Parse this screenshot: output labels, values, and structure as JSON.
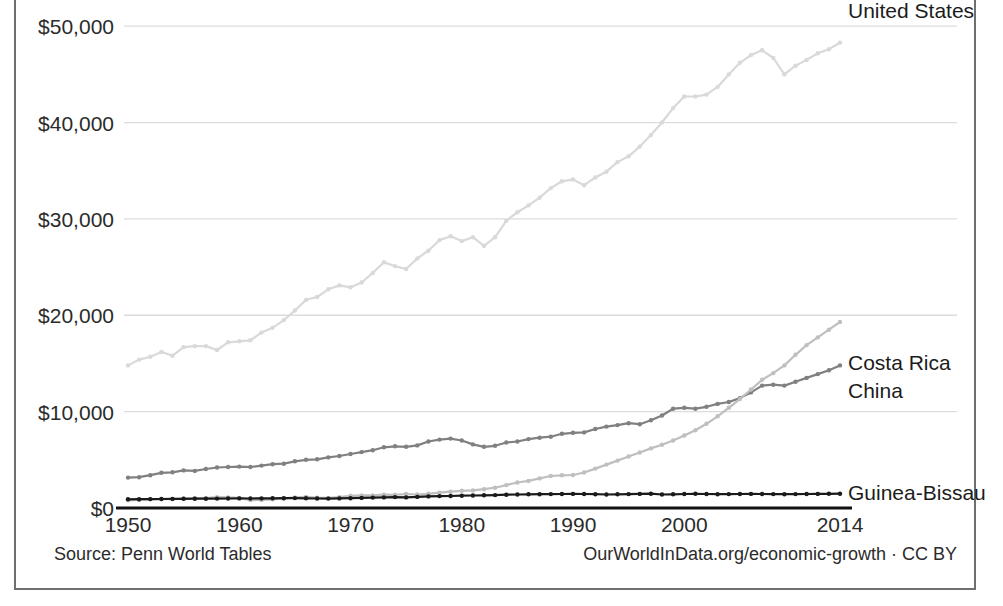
{
  "footer": {
    "source_label": "Source: Penn World Tables",
    "credit_label": "OurWorldInData.org/economic-growth · CC BY"
  },
  "axes": {
    "y_ticks": [
      "$0",
      "$10,000",
      "$20,000",
      "$30,000",
      "$40,000",
      "$50,000"
    ],
    "y_tick_values": [
      0,
      10000,
      20000,
      30000,
      40000,
      50000
    ],
    "x_ticks": [
      "1950",
      "1960",
      "1970",
      "1980",
      "1990",
      "2000",
      "2014"
    ],
    "x_tick_values": [
      1950,
      1960,
      1970,
      1980,
      1990,
      2000,
      2014
    ]
  },
  "series_labels": {
    "united_states": "United States",
    "costa_rica": "Costa Rica",
    "china": "China",
    "guinea_bissau": "Guinea-Bissau"
  },
  "colors": {
    "united_states": "#d9d9d9",
    "costa_rica": "#808080",
    "china": "#bfbfbf",
    "guinea_bissau": "#1a1a1a",
    "gridline": "#dcdcdc",
    "axis": "#111111",
    "frame": "#6f6f6f",
    "text": "#1f1f1f"
  },
  "chart_data": {
    "type": "line",
    "title": "",
    "xlabel": "",
    "ylabel": "",
    "xlim": [
      1950,
      2014
    ],
    "ylim": [
      0,
      55000
    ],
    "grid": true,
    "legend": "inline-right-labels",
    "x": [
      1950,
      1951,
      1952,
      1953,
      1954,
      1955,
      1956,
      1957,
      1958,
      1959,
      1960,
      1961,
      1962,
      1963,
      1964,
      1965,
      1966,
      1967,
      1968,
      1969,
      1970,
      1971,
      1972,
      1973,
      1974,
      1975,
      1976,
      1977,
      1978,
      1979,
      1980,
      1981,
      1982,
      1983,
      1984,
      1985,
      1986,
      1987,
      1988,
      1989,
      1990,
      1991,
      1992,
      1993,
      1994,
      1995,
      1996,
      1997,
      1998,
      1999,
      2000,
      2001,
      2002,
      2003,
      2004,
      2005,
      2006,
      2007,
      2008,
      2009,
      2010,
      2011,
      2012,
      2013,
      2014
    ],
    "series": [
      {
        "name": "United States",
        "color": "#d9d9d9",
        "values": [
          14800,
          15400,
          15700,
          16200,
          15800,
          16700,
          16800,
          16800,
          16400,
          17200,
          17300,
          17400,
          18200,
          18700,
          19500,
          20500,
          21600,
          21900,
          22700,
          23100,
          22900,
          23400,
          24400,
          25500,
          25100,
          24800,
          25900,
          26700,
          27800,
          28200,
          27700,
          28100,
          27200,
          28100,
          29800,
          30700,
          31400,
          32200,
          33200,
          33900,
          34100,
          33500,
          34300,
          34900,
          35900,
          36500,
          37500,
          38700,
          40000,
          41500,
          42700,
          42700,
          42900,
          43700,
          45000,
          46200,
          47000,
          47500,
          46700,
          45000,
          45900,
          46500,
          47200,
          47600,
          48300
        ],
        "y_end_label": "United States"
      },
      {
        "name": "Costa Rica",
        "color": "#808080",
        "values": [
          3150,
          3200,
          3400,
          3650,
          3700,
          3900,
          3850,
          4050,
          4200,
          4250,
          4300,
          4250,
          4400,
          4550,
          4600,
          4850,
          5000,
          5050,
          5250,
          5400,
          5600,
          5800,
          6000,
          6300,
          6400,
          6350,
          6500,
          6900,
          7100,
          7200,
          7000,
          6600,
          6350,
          6450,
          6800,
          6900,
          7150,
          7300,
          7400,
          7700,
          7800,
          7850,
          8200,
          8450,
          8600,
          8800,
          8700,
          9100,
          9600,
          10300,
          10400,
          10300,
          10500,
          10800,
          11000,
          11400,
          12000,
          12700,
          12800,
          12700,
          13100,
          13500,
          13900,
          14300,
          14800
        ],
        "y_end_label": "Costa Rica"
      },
      {
        "name": "China",
        "color": "#bfbfbf",
        "values": [
          800,
          830,
          900,
          920,
          930,
          960,
          1010,
          1030,
          1120,
          1100,
          1050,
          820,
          830,
          900,
          1000,
          1100,
          1150,
          1080,
          1050,
          1130,
          1270,
          1310,
          1310,
          1380,
          1370,
          1450,
          1400,
          1470,
          1600,
          1690,
          1780,
          1830,
          1950,
          2110,
          2380,
          2650,
          2810,
          3070,
          3320,
          3390,
          3420,
          3680,
          4090,
          4500,
          4920,
          5340,
          5760,
          6190,
          6570,
          7000,
          7520,
          8070,
          8740,
          9520,
          10400,
          11300,
          12300,
          13300,
          14000,
          14800,
          15900,
          16900,
          17700,
          18500,
          19300
        ],
        "y_end_label": "China"
      },
      {
        "name": "Guinea-Bissau",
        "color": "#1a1a1a",
        "values": [
          900,
          910,
          920,
          930,
          940,
          950,
          960,
          970,
          980,
          990,
          1000,
          990,
          1000,
          1010,
          1020,
          1030,
          1010,
          990,
          980,
          1000,
          1020,
          1050,
          1080,
          1100,
          1130,
          1100,
          1150,
          1200,
          1230,
          1250,
          1280,
          1300,
          1320,
          1340,
          1380,
          1400,
          1420,
          1430,
          1440,
          1450,
          1460,
          1450,
          1430,
          1400,
          1420,
          1440,
          1460,
          1480,
          1400,
          1420,
          1450,
          1470,
          1450,
          1430,
          1440,
          1450,
          1460,
          1450,
          1440,
          1430,
          1440,
          1450,
          1460,
          1470,
          1480
        ],
        "y_end_label": "Guinea-Bissau"
      }
    ]
  }
}
